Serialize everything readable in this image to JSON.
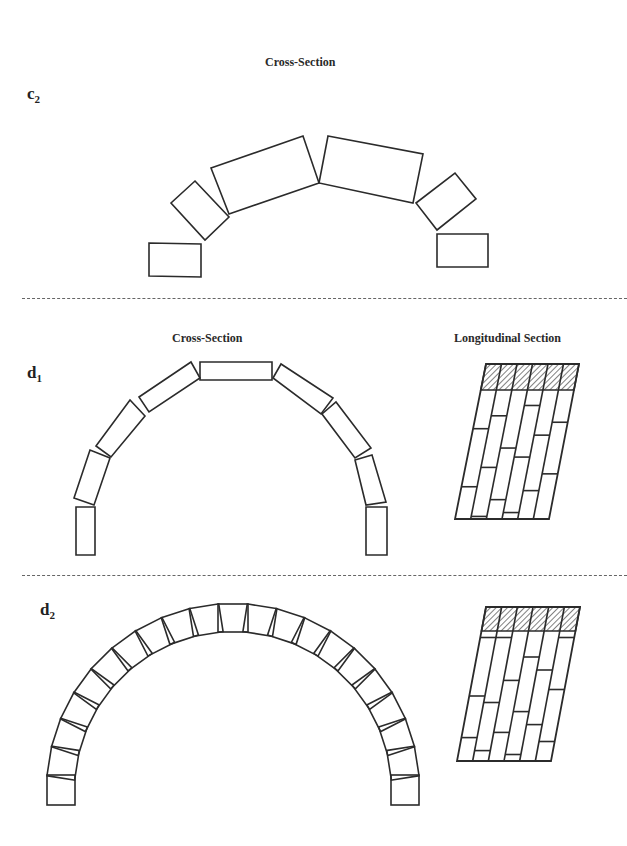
{
  "panels": [
    {
      "id": "c2",
      "label_main": "c",
      "label_sub": "2",
      "titles": {
        "cross": "Cross-Section"
      },
      "cross_section_stones": [
        [
          [
            149,
            243
          ],
          [
            201,
            244
          ],
          [
            201,
            277
          ],
          [
            149,
            276
          ]
        ],
        [
          [
            195,
            181
          ],
          [
            229,
            217
          ],
          [
            205,
            240
          ],
          [
            171,
            203
          ]
        ],
        [
          [
            211,
            168
          ],
          [
            303,
            136
          ],
          [
            319,
            183
          ],
          [
            229,
            214
          ]
        ],
        [
          [
            328,
            136
          ],
          [
            423,
            154
          ],
          [
            413,
            203
          ],
          [
            319,
            183
          ]
        ],
        [
          [
            416,
            203
          ],
          [
            455,
            173
          ],
          [
            476,
            199
          ],
          [
            437,
            230
          ]
        ],
        [
          [
            437,
            234
          ],
          [
            488,
            234
          ],
          [
            488,
            267
          ],
          [
            437,
            267
          ]
        ]
      ]
    },
    {
      "id": "d1",
      "label_main": "d",
      "label_sub": "1",
      "titles": {
        "cross": "Cross-Section",
        "longitudinal": "Longitudinal Section"
      },
      "cross_section_stones": [
        [
          [
            76,
            507
          ],
          [
            95,
            507
          ],
          [
            95,
            555
          ],
          [
            76,
            555
          ]
        ],
        [
          [
            74,
            498
          ],
          [
            90,
            450
          ],
          [
            110,
            458
          ],
          [
            94,
            505
          ]
        ],
        [
          [
            96,
            446
          ],
          [
            130,
            400
          ],
          [
            145,
            416
          ],
          [
            111,
            457
          ]
        ],
        [
          [
            139,
            397
          ],
          [
            191,
            362
          ],
          [
            200,
            378
          ],
          [
            149,
            412
          ]
        ],
        [
          [
            200,
            362
          ],
          [
            272,
            362
          ],
          [
            272,
            380
          ],
          [
            200,
            380
          ]
        ],
        [
          [
            273,
            378
          ],
          [
            281,
            364
          ],
          [
            333,
            398
          ],
          [
            321,
            414
          ]
        ],
        [
          [
            322,
            414
          ],
          [
            336,
            402
          ],
          [
            371,
            448
          ],
          [
            355,
            458
          ]
        ],
        [
          [
            355,
            460
          ],
          [
            372,
            455
          ],
          [
            386,
            502
          ],
          [
            366,
            505
          ]
        ],
        [
          [
            366,
            507
          ],
          [
            387,
            507
          ],
          [
            387,
            555
          ],
          [
            366,
            555
          ]
        ]
      ],
      "longitudinal": {
        "top": 364,
        "bottom": 519,
        "topLeft": 486,
        "topRight": 579,
        "bottomLeft": 455,
        "bottomRight": 549,
        "hatchBottom": 390,
        "columns": 6,
        "courseBreaks": [
          [
            0.3,
            0.75
          ],
          [
            0.2,
            0.6,
            0.98
          ],
          [
            0.45,
            0.85
          ],
          [
            0.12,
            0.52,
            0.95
          ],
          [
            0.35,
            0.78
          ],
          [
            0.25,
            0.65
          ]
        ]
      }
    },
    {
      "id": "d2",
      "label_main": "d",
      "label_sub": "2",
      "titles": {},
      "arch": {
        "cx": 233,
        "cy": 790,
        "r": 172,
        "count": 21,
        "w": 30,
        "h": 28
      },
      "longitudinal": {
        "top": 607,
        "bottom": 761,
        "topLeft": 486,
        "topRight": 580,
        "bottomLeft": 457,
        "bottomRight": 551,
        "hatchBottom": 631,
        "columns": 6,
        "courseBreaks": [
          [
            0.05,
            0.5,
            0.82
          ],
          [
            0.05,
            0.55,
            0.92
          ],
          [
            0.38,
            0.78
          ],
          [
            0.2,
            0.62,
            0.95
          ],
          [
            0.3,
            0.72
          ],
          [
            0.05,
            0.45,
            0.85
          ]
        ]
      }
    }
  ],
  "colors": {
    "stroke": "#2b2b2b",
    "divider": "#666666"
  }
}
